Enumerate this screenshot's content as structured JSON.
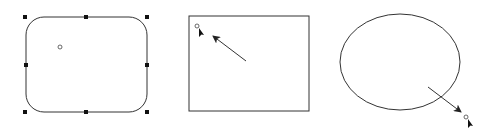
{
  "diagram": {
    "background": "#ffffff",
    "stroke_color": "#333333",
    "shapes": [
      {
        "id": "rounded-rectangle",
        "type": "rounded-rectangle",
        "selected": true,
        "x": 26,
        "y": 17,
        "width": 121,
        "height": 95,
        "corner_radius": 18,
        "handles": [
          {
            "x": 25,
            "y": 17
          },
          {
            "x": 86,
            "y": 17
          },
          {
            "x": 147,
            "y": 17
          },
          {
            "x": 26,
            "y": 65
          },
          {
            "x": 147,
            "y": 65
          },
          {
            "x": 25,
            "y": 112
          },
          {
            "x": 86,
            "y": 112
          },
          {
            "x": 147,
            "y": 112
          }
        ],
        "rotation_point": {
          "x": 60,
          "y": 47
        }
      },
      {
        "id": "rectangle",
        "type": "rectangle",
        "selected": false,
        "x": 189,
        "y": 16,
        "width": 120,
        "height": 95,
        "cursor": {
          "x": 197,
          "y": 26,
          "icon": "pointer-cursor-icon"
        },
        "arrow": {
          "x1": 246,
          "y1": 61,
          "x2": 213,
          "y2": 36
        }
      },
      {
        "id": "ellipse",
        "type": "ellipse",
        "selected": false,
        "cx": 400,
        "cy": 62,
        "rx": 60,
        "ry": 48,
        "arrow": {
          "x1": 428,
          "y1": 87,
          "x2": 461,
          "y2": 112
        },
        "cursor": {
          "x": 466,
          "y": 117,
          "icon": "pointer-cursor-icon"
        }
      }
    ]
  }
}
